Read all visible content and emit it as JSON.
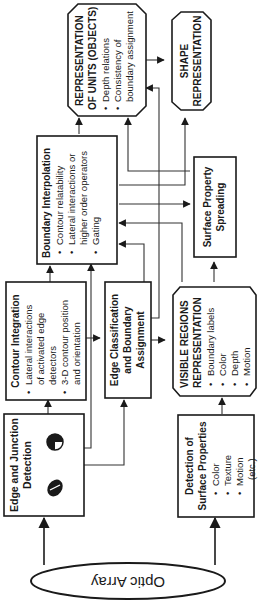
{
  "diagram": {
    "orientation": "rotated 90deg counter-clockwise",
    "input": {
      "label": "Optic Array"
    },
    "nodes": {
      "edge_junction": {
        "title_1": "Edge and Junction",
        "title_2": "Detection",
        "icons": [
          "junction-disk-icon",
          "edge-oriented-disk-icon"
        ]
      },
      "contour_integration": {
        "title": "Contour Integration",
        "bullets": [
          "Lateral interactions",
          "of activated edge",
          "detectors",
          "3-D contour position",
          "and orientation"
        ]
      },
      "boundary_interpolation": {
        "title": "Boundary Interpolation",
        "bullets": [
          "Contour relatability",
          "Lateral interactions or",
          "higher order operators",
          "Gating"
        ]
      },
      "edge_classification": {
        "title_1": "Edge Classification",
        "title_2": "and Boundary",
        "title_3": "Assignment"
      },
      "representation_units": {
        "title_1": "REPRESENTATION",
        "title_2": "OF UNITS (OBJECTS)",
        "bullets": [
          "Depth relations",
          "Consistency of",
          "boundary assignment"
        ]
      },
      "shape_representation": {
        "title_1": "SHAPE",
        "title_2": "REPRESENTATION"
      },
      "surface_detection": {
        "title_1": "Detection of",
        "title_2": "Surface Properties",
        "bullets": [
          "Color",
          "Texture",
          "Motion",
          "(etc.)"
        ]
      },
      "visible_regions": {
        "title_1": "VISIBLE REGIONS",
        "title_2": "REPRESENTATION",
        "bullets": [
          "Boundary labels",
          "Color",
          "Depth",
          "Motion"
        ]
      },
      "surface_spreading": {
        "title_1": "Surface Property",
        "title_2": "Spreading"
      }
    },
    "bullet_char": "•"
  }
}
